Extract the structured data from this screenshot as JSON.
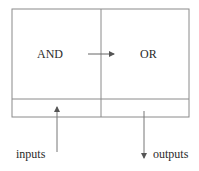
{
  "diagram": {
    "blocks": [
      {
        "id": "and",
        "label": "AND"
      },
      {
        "id": "or",
        "label": "OR"
      }
    ],
    "connections": [
      {
        "from": "and",
        "to": "or",
        "type": "arrow"
      }
    ],
    "io": {
      "inputs_label": "inputs",
      "outputs_label": "outputs"
    },
    "colors": {
      "line": "#8a8a8a",
      "text": "#2a2a2a",
      "background": "#ffffff"
    }
  }
}
